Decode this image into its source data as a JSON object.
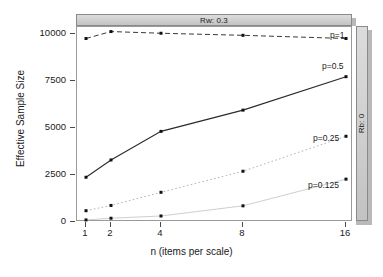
{
  "chart_data": {
    "type": "line",
    "title": "",
    "xlabel": "n (items per scale)",
    "ylabel": "Effective Sample Size",
    "x": [
      1,
      2,
      4,
      8,
      16
    ],
    "xtick_labels": [
      "1",
      "2",
      "4",
      "8",
      "16"
    ],
    "xscale": "log2",
    "ytick_labels": [
      "0",
      "2500",
      "5000",
      "7500",
      "10000"
    ],
    "ytick_values": [
      0,
      2500,
      5000,
      7500,
      10000
    ],
    "ylim": [
      -500,
      10800
    ],
    "grid": false,
    "legend_position": "inline-right",
    "strip_top_label": "Rw: 0.3",
    "strip_right_label": "Rb: 0",
    "series": [
      {
        "name": "p=1",
        "label": "p=1",
        "values": [
          9760,
          10130,
          10040,
          9930,
          9760
        ],
        "linestyle": "dashed",
        "color": "#3a3a3a"
      },
      {
        "name": "p=0.5",
        "label": "p=0.5",
        "values": [
          2380,
          3300,
          4820,
          5950,
          7730
        ],
        "linestyle": "solid",
        "color": "#2b2b2b"
      },
      {
        "name": "p=0.25",
        "label": "p=0.25",
        "values": [
          600,
          880,
          1580,
          2700,
          4560
        ],
        "linestyle": "dotted",
        "color": "#b4b4b4"
      },
      {
        "name": "p=0.125",
        "label": "p=0.125",
        "values": [
          110,
          200,
          320,
          860,
          2280
        ],
        "linestyle": "solid-light",
        "color": "#c8c8c8"
      }
    ]
  },
  "axis": {
    "ylabel": "Effective Sample Size",
    "xlabel": "n (items per scale)",
    "ytick_0": "0",
    "ytick_1": "2500",
    "ytick_2": "5000",
    "ytick_3": "7500",
    "ytick_4": "10000",
    "xtick_0": "1",
    "xtick_1": "2",
    "xtick_2": "4",
    "xtick_3": "8",
    "xtick_4": "16"
  },
  "strips": {
    "top": "Rw: 0.3",
    "right": "Rb: 0"
  },
  "series_labels": {
    "p1": "p=1",
    "p05": "p=0.5",
    "p025": "p=0.25",
    "p0125": "p=0.125"
  }
}
